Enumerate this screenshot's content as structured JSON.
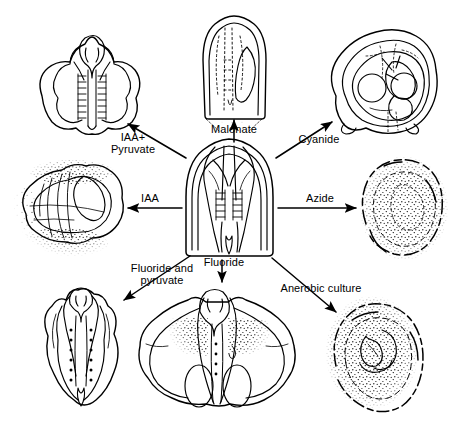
{
  "figure": {
    "type": "radial-treatment-diagram",
    "style": "pen-and-ink line drawing",
    "center": {
      "name": "control-embryo",
      "description": "untreated normal embryo with central vascular strands"
    }
  },
  "treatments": [
    {
      "id": "iaa-pyruvate",
      "label": "IAA+\nPyruvate",
      "direction": "up-left",
      "specimen": "elongated embryo with prominent ladder-like central axis"
    },
    {
      "id": "malonate",
      "label": "Malonate",
      "direction": "up",
      "specimen": "pale embryo with faint dotted interior and basal stipple"
    },
    {
      "id": "cyanide",
      "label": "Cyanide",
      "direction": "up-right",
      "specimen": "rounded irregular body with circular internal vesicles"
    },
    {
      "id": "iaa",
      "label": "IAA",
      "direction": "left",
      "specimen": "broad embryo surrounded by stippled halo"
    },
    {
      "id": "azide",
      "label": "Azide",
      "direction": "right",
      "specimen": "densely stippled rounded mass, outline degraded"
    },
    {
      "id": "fluoride-pyruvate",
      "label": "Fluoride and\npyruvate",
      "direction": "down-left",
      "specimen": "slender elongated embryo with dotted median line"
    },
    {
      "id": "fluoride",
      "label": "Fluoride",
      "direction": "down",
      "specimen": "wide winged embryo with two basal ovals"
    },
    {
      "id": "anerobic-culture",
      "label": "Anerobic culture",
      "direction": "down-right",
      "specimen": "heavily stippled oval with small internal coil"
    }
  ],
  "labels": {
    "iaa_pyruvate_line1": "IAA+",
    "iaa_pyruvate_line2": "Pyruvate",
    "malonate": "Malonate",
    "cyanide": "Cyanide",
    "iaa": "IAA",
    "azide": "Azide",
    "fluoride_and_line1": "Fluoride and",
    "fluoride_and_line2": "pyruvate",
    "fluoride": "Fluoride",
    "anerobic": "Anerobic culture"
  },
  "colors": {
    "ink": "#000000",
    "paper": "#ffffff"
  }
}
